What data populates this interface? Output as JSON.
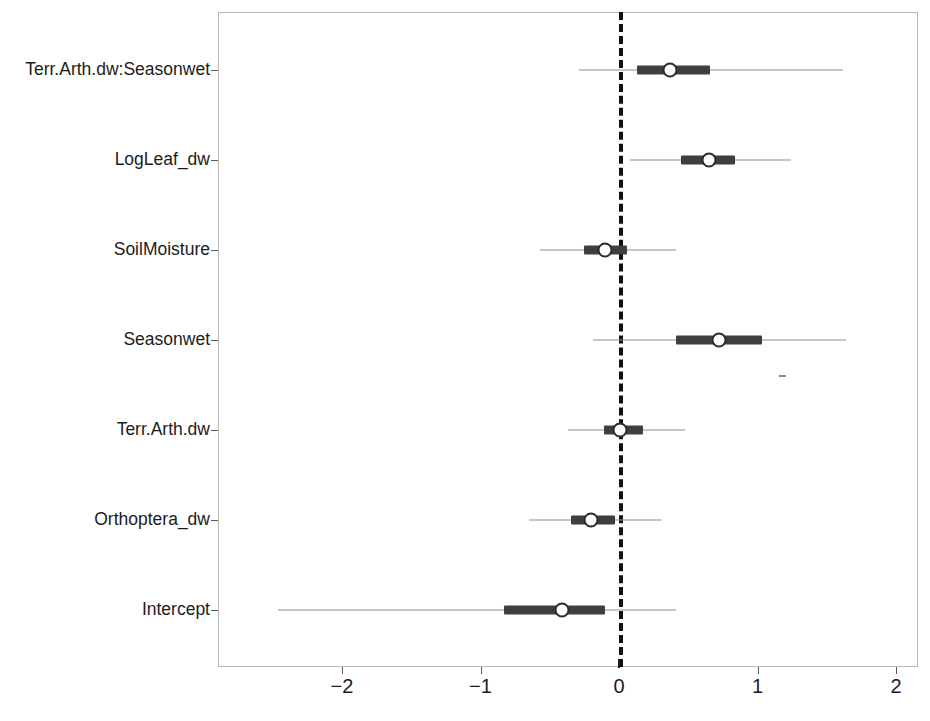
{
  "chart_data": {
    "type": "scatter",
    "subtype": "forest-plot-coefficient-plot",
    "title": "",
    "xlabel": "",
    "ylabel": "",
    "xlim": [
      -2.85,
      2.1
    ],
    "ylim_categories": 7,
    "grid": false,
    "legend": null,
    "reference_line": {
      "x": 0,
      "style": "dashed",
      "color": "#111111"
    },
    "x_ticks": [
      {
        "label": "−2",
        "value": -2
      },
      {
        "label": "−1",
        "value": -1
      },
      {
        "label": "0",
        "value": 0
      },
      {
        "label": "1",
        "value": 1
      },
      {
        "label": "2",
        "value": 2
      }
    ],
    "categories": [
      "Terr.Arth.dw:Seasonwet",
      "LogLeaf_dw",
      "SoilMoisture",
      "Seasonwet",
      "Terr.Arth.dw",
      "Orthoptera_dw",
      "Intercept"
    ],
    "series": [
      {
        "name": "Posterior estimate",
        "marker": "open-circle",
        "inner_interval": "50%",
        "outer_interval": "95%",
        "points": [
          {
            "category": "Terr.Arth.dw:Seasonwet",
            "estimate": 0.37,
            "inner_low": 0.13,
            "inner_high": 0.66,
            "outer_low": -0.29,
            "outer_high": 1.62
          },
          {
            "category": "LogLeaf_dw",
            "estimate": 0.65,
            "inner_low": 0.45,
            "inner_high": 0.84,
            "outer_low": 0.08,
            "outer_high": 1.24
          },
          {
            "category": "SoilMoisture",
            "estimate": -0.1,
            "inner_low": -0.25,
            "inner_high": 0.06,
            "outer_low": -0.57,
            "outer_high": 0.41
          },
          {
            "category": "Seasonwet",
            "estimate": 0.72,
            "inner_low": 0.41,
            "inner_high": 1.03,
            "outer_low": -0.19,
            "outer_high": 1.64
          },
          {
            "category": "Terr.Arth.dw",
            "estimate": 0.01,
            "inner_low": -0.11,
            "inner_high": 0.17,
            "outer_low": -0.37,
            "outer_high": 0.48
          },
          {
            "category": "Orthoptera_dw",
            "estimate": -0.2,
            "inner_low": -0.35,
            "inner_high": -0.03,
            "outer_low": -0.65,
            "outer_high": 0.31
          },
          {
            "category": "Intercept",
            "estimate": -0.41,
            "inner_low": -0.83,
            "inner_high": -0.1,
            "outer_low": -2.46,
            "outer_high": 0.41
          }
        ]
      }
    ]
  },
  "axes": {
    "y_tick_labels": [
      "Terr.Arth.dw:Seasonwet",
      "LogLeaf_dw",
      "SoilMoisture",
      "Seasonwet",
      "Terr.Arth.dw",
      "Orthoptera_dw",
      "Intercept"
    ],
    "x_tick_labels": [
      "−2",
      "−1",
      "0",
      "1",
      "2"
    ]
  },
  "colors": {
    "marker_fill": "#ffffff",
    "marker_edge": "#2b2b2b",
    "inner_interval": "#3f3f3f",
    "outer_interval": "#8d8d8d",
    "reference_line": "#111111",
    "panel_border": "#b9b9b9",
    "background": "#ffffff",
    "text": "#1c1c1c"
  }
}
